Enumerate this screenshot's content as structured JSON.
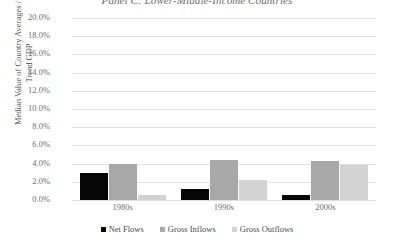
{
  "chart_data": {
    "type": "bar",
    "title": "Panel C: Lower-Middle-Income Countries",
    "xlabel": "",
    "ylabel": "Median Value of Country Averages / Trend GDP",
    "ylabel_line1": "Median Value of Country Averages /",
    "ylabel_line2": "Trend GDP",
    "categories": [
      "1980s",
      "1990s",
      "2000s"
    ],
    "series": [
      {
        "name": "Net Flows",
        "color": "#050505",
        "values": [
          3.0,
          1.2,
          0.5
        ]
      },
      {
        "name": "Gross Inflows",
        "color": "#a8a8a8",
        "values": [
          4.0,
          4.4,
          4.3
        ]
      },
      {
        "name": "Gross Outflows",
        "color": "#d2d2d2",
        "values": [
          0.5,
          2.2,
          3.9
        ]
      }
    ],
    "ylim": [
      0.0,
      20.0
    ],
    "ytick_values": [
      20.0,
      18.0,
      16.0,
      14.0,
      12.0,
      10.0,
      8.0,
      6.0,
      4.0,
      2.0,
      0.0
    ],
    "ytick_labels": [
      "20.0%",
      "18.0%",
      "16.0%",
      "14.0%",
      "12.0%",
      "10.0%",
      "8.0%",
      "6.0%",
      "4.0%",
      "2.0%",
      "0.0%"
    ],
    "grid": true,
    "legend_position": "bottom",
    "legend_labels": [
      "Net Flows",
      "Gross Inflows",
      "Gross Outflows"
    ]
  }
}
